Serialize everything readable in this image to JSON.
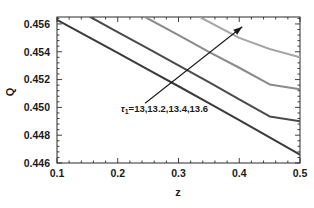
{
  "chart_data": {
    "type": "line",
    "title": "",
    "xlabel": "z",
    "ylabel": "Q",
    "xlim": [
      0.1,
      0.5
    ],
    "ylim": [
      0.446,
      0.4565
    ],
    "grid": false,
    "legend": "none",
    "xticks": [
      "0.1",
      "0.2",
      "0.3",
      "0.4",
      "0.5"
    ],
    "xtick_values": [
      0.1,
      0.2,
      0.3,
      0.4,
      0.5
    ],
    "yticks": [
      "0.446",
      "0.448",
      "0.450",
      "0.452",
      "0.454",
      "0.456"
    ],
    "ytick_values": [
      0.446,
      0.448,
      0.45,
      0.452,
      0.454,
      0.456
    ],
    "x_minor_tick_step": 0.02,
    "y_minor_tick_step": 0.0004,
    "annotations": [
      {
        "name": "parameter-annotation",
        "text_prefix": "τ",
        "text_sub": "1",
        "text_rest": "=13,13.2,13.4,13.6",
        "x": 0.205,
        "y": 0.4497
      },
      {
        "name": "trend-arrow",
        "kind": "arrow",
        "x_start": 0.245,
        "y_start": 0.4503,
        "x_end": 0.405,
        "y_end": 0.4558,
        "meaning": "increasing tau1"
      }
    ],
    "series": [
      {
        "name": "τ₁ = 13",
        "tau1": 13,
        "color": "#3a3a3a",
        "width": 2.0,
        "x": [
          0.1,
          0.15,
          0.2,
          0.25,
          0.3,
          0.35,
          0.4,
          0.45,
          0.5
        ],
        "values": [
          0.4563,
          0.45511,
          0.45392,
          0.45272,
          0.45152,
          0.45031,
          0.44908,
          0.44785,
          0.4466
        ]
      },
      {
        "name": "τ₁ = 13.2",
        "tau1": 13.2,
        "color": "#4a4a4a",
        "width": 2.0,
        "x": [
          0.155,
          0.2,
          0.25,
          0.3,
          0.35,
          0.4,
          0.45,
          0.5
        ],
        "values": [
          0.4565,
          0.45542,
          0.45422,
          0.45302,
          0.45181,
          0.45058,
          0.44935,
          0.449
        ]
      },
      {
        "name": "τ₁ = 13.4",
        "tau1": 13.4,
        "color": "#8a8a8a",
        "width": 2.0,
        "x": [
          0.245,
          0.3,
          0.35,
          0.4,
          0.45,
          0.5
        ],
        "values": [
          0.4565,
          0.4552,
          0.454,
          0.45285,
          0.45165,
          0.4513
        ]
      },
      {
        "name": "τ₁ = 13.6",
        "tau1": 13.6,
        "color": "#a6a6a6",
        "width": 2.0,
        "x": [
          0.335,
          0.4,
          0.45,
          0.5
        ],
        "values": [
          0.4565,
          0.455,
          0.4542,
          0.4536
        ]
      }
    ]
  },
  "figure": {
    "background": "#ffffff",
    "axis_color": "#2b2b2b"
  }
}
